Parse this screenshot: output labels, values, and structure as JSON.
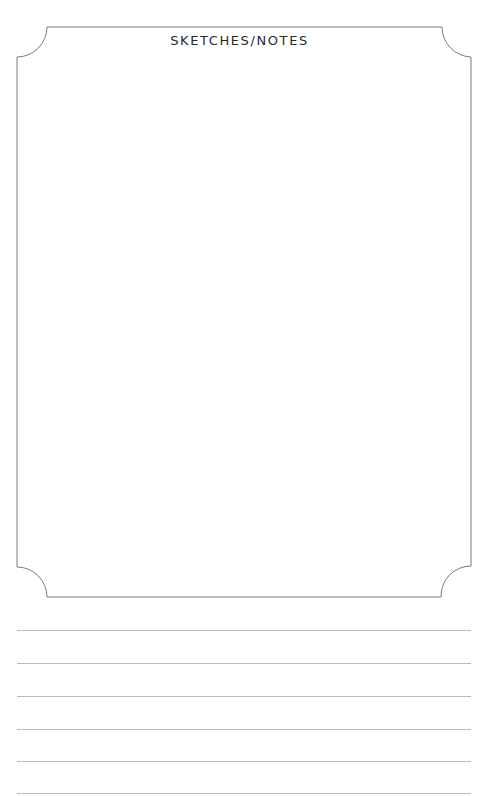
{
  "page": {
    "title": "SKETCHES/NOTES",
    "frame": {
      "left": 17,
      "top": 27,
      "right": 471,
      "bottom": 597,
      "corner_radius": 30,
      "stroke": "#7a7a7a"
    },
    "ruled_lines": {
      "count": 6,
      "y_positions": [
        630,
        663,
        696,
        729,
        761,
        793
      ],
      "color": "#bdbdbd"
    }
  }
}
